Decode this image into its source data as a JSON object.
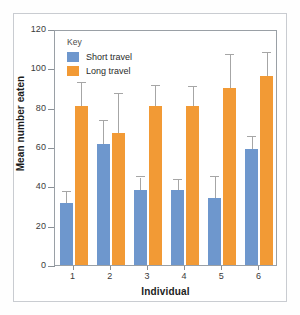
{
  "chart_data": {
    "type": "bar",
    "title": "",
    "xlabel": "Individual",
    "ylabel": "Mean number eaten",
    "categories": [
      "1",
      "2",
      "3",
      "4",
      "5",
      "6"
    ],
    "ylim": [
      0,
      120
    ],
    "yticks": [
      0,
      20,
      40,
      60,
      80,
      100,
      120
    ],
    "grid": false,
    "legend_title": "Key",
    "legend_position": "top-left inside plot",
    "series": [
      {
        "name": "Short travel",
        "color": "#6e97cd",
        "values": [
          31.5,
          61.5,
          38,
          38,
          34,
          59
        ],
        "error_upper": [
          37,
          73,
          44.5,
          43,
          45,
          65
        ]
      },
      {
        "name": "Long travel",
        "color": "#f29a35",
        "values": [
          81,
          67,
          81,
          81,
          90,
          96
        ],
        "error_upper": [
          92.5,
          87,
          91,
          90.5,
          107,
          108
        ]
      }
    ]
  },
  "axes": {
    "y_tick_labels": [
      "120",
      "100",
      "80",
      "60",
      "40",
      "20",
      "0"
    ],
    "x_tick_labels": [
      "1",
      "2",
      "3",
      "4",
      "5",
      "6"
    ],
    "y_title": "Mean number eaten",
    "x_title": "Individual"
  },
  "legend": {
    "title": "Key",
    "items": [
      {
        "label": "Short travel",
        "color": "#6e97cd"
      },
      {
        "label": "Long travel",
        "color": "#f29a35"
      }
    ]
  },
  "colors": {
    "short_travel": "#6e97cd",
    "long_travel": "#f29a35",
    "axis": "#8a9096",
    "error_bar": "#a6a6a6",
    "frame": "#c9ccd1"
  }
}
